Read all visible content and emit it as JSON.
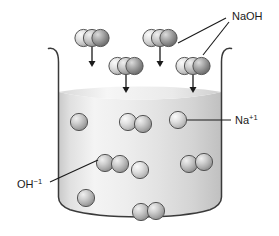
{
  "figure": {
    "type": "molecular-diagram",
    "background_color": "#ffffff",
    "line_color": "#1a1a1a"
  },
  "labels": {
    "naoh": {
      "text": "NaOH",
      "x": 232,
      "y": 16
    },
    "sodium_ion": {
      "base": "Na",
      "charge": "+1",
      "x": 235,
      "y": 123
    },
    "hydroxide_ion": {
      "base": "OH",
      "charge": "−1",
      "x": 17,
      "y": 185
    }
  },
  "beaker": {
    "name": "beaker",
    "left": 58,
    "right": 222,
    "top": 47,
    "bottom": 212,
    "wall_color": "#333333",
    "liquid": {
      "name": "liquid",
      "surface_y": 92,
      "color_light": "#f2f2f2",
      "color_mid": "#d9d9d9",
      "color_dark": "#c2c2c2"
    }
  },
  "spheres": {
    "light_color": "#e8e8e8",
    "mid_color": "#b8b8b8",
    "dark_color": "#8c8c8c",
    "outline_color": "#4a4a4a",
    "radius": 8.5
  },
  "naoh_molecules": [
    {
      "id": "naoh-1",
      "x": 92,
      "y": 38,
      "arrow_from_y": 49,
      "arrow_to_y": 70
    },
    {
      "id": "naoh-2",
      "x": 160,
      "y": 38,
      "arrow_from_y": 49,
      "arrow_to_y": 70
    },
    {
      "id": "naoh-3",
      "x": 126,
      "y": 65,
      "arrow_from_y": 76,
      "arrow_to_y": 95
    },
    {
      "id": "naoh-4",
      "x": 193,
      "y": 65,
      "arrow_from_y": 76,
      "arrow_to_y": 95
    }
  ],
  "sodium_ions": [
    {
      "id": "na-1",
      "x": 79,
      "y": 122
    },
    {
      "id": "na-2",
      "x": 178,
      "y": 120
    },
    {
      "id": "na-3",
      "x": 140,
      "y": 170
    },
    {
      "id": "na-4",
      "x": 86,
      "y": 198
    }
  ],
  "hydroxide_ions": [
    {
      "id": "oh-1",
      "x": 133,
      "y": 122
    },
    {
      "id": "oh-2",
      "x": 110,
      "y": 163
    },
    {
      "id": "oh-3",
      "x": 195,
      "y": 163
    },
    {
      "id": "oh-4",
      "x": 148,
      "y": 211
    }
  ],
  "leader_lines": {
    "naoh_upper": {
      "x1": 183,
      "y1": 44,
      "x2": 226,
      "y2": 19
    },
    "naoh_lower": {
      "x1": 203,
      "y1": 52,
      "x2": 228,
      "y2": 22
    },
    "sodium": {
      "x1": 187,
      "y1": 120,
      "x2": 231,
      "y2": 120
    },
    "hydroxide": {
      "x1": 100,
      "y1": 160,
      "x2": 48,
      "y2": 183
    }
  }
}
